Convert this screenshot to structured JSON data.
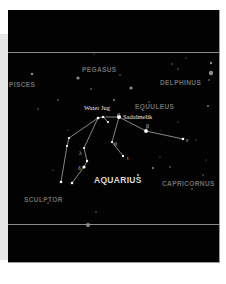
{
  "chart": {
    "title": "AQUARIUS",
    "neighboring_constellations": [
      {
        "name": "PEGASUS",
        "x": 74,
        "y": 57
      },
      {
        "name": "PISCES",
        "x": 1,
        "y": 72
      },
      {
        "name": "DELPHINUS",
        "x": 152,
        "y": 70
      },
      {
        "name": "EQUULEUS",
        "x": 127,
        "y": 94
      },
      {
        "name": "CAPRICORNUS",
        "x": 154,
        "y": 171
      },
      {
        "name": "SCULPTOR",
        "x": 16,
        "y": 187
      }
    ],
    "main_label": {
      "name": "AQUARIUS",
      "x": 86,
      "y": 166
    },
    "star_labels": [
      {
        "name": "Water Jug",
        "x": 76,
        "y": 95
      },
      {
        "name": "Sadalmelik",
        "x": 115,
        "y": 104
      }
    ],
    "greek_labels": [
      {
        "letter": "α",
        "x": 109,
        "y": 101
      },
      {
        "letter": "β",
        "x": 138,
        "y": 113
      },
      {
        "letter": "ε",
        "x": 178,
        "y": 127
      },
      {
        "letter": "λ",
        "x": 71,
        "y": 140
      },
      {
        "letter": "δ",
        "x": 70,
        "y": 155
      },
      {
        "letter": "θ",
        "x": 106,
        "y": 131
      },
      {
        "letter": "ι",
        "x": 119,
        "y": 145
      }
    ],
    "colors": {
      "sky": "#020202",
      "lines": "#e0e0e0",
      "stars": "#ffffff",
      "faint_labels": "#6e6e6e",
      "main_label": "#d8d8d8",
      "rules": "#8a8a8a"
    }
  }
}
